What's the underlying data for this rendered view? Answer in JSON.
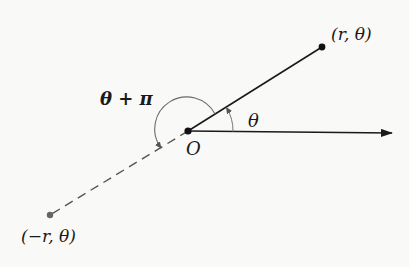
{
  "diagram": {
    "type": "polar-coordinates",
    "colors": {
      "ink": "#1a1a1a",
      "dashed": "#555555",
      "arc": "#6a6a6a",
      "background": "#f9f9f8"
    },
    "origin": {
      "label": "O",
      "x": 188,
      "y": 131
    },
    "point_positive": {
      "label": "(r, θ)",
      "x": 322,
      "y": 47
    },
    "point_negative": {
      "label": "(−r, θ)",
      "x": 50,
      "y": 215
    },
    "polar_axis": {
      "x1": 188,
      "y1": 131,
      "x2": 392,
      "y2": 133
    },
    "angle_theta": {
      "label": "θ",
      "radius": 45
    },
    "angle_theta_plus_pi": {
      "label": "θ + π",
      "radius": 32
    }
  }
}
